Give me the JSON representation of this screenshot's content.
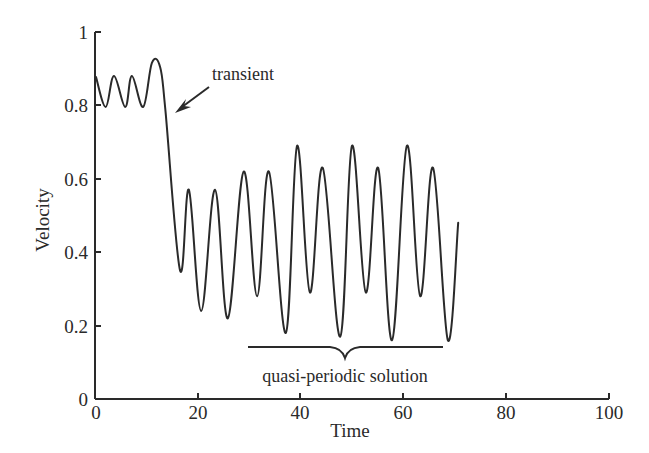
{
  "chart_data": {
    "type": "line",
    "title": "",
    "xlabel": "Time",
    "ylabel": "Velocity",
    "xlim": [
      0,
      100
    ],
    "ylim": [
      0,
      1
    ],
    "grid": false,
    "legend": null,
    "x_ticks": [
      0,
      20,
      40,
      60,
      80,
      100
    ],
    "x_tick_labels": [
      "0",
      "20",
      "40",
      "60",
      "80",
      "100"
    ],
    "y_ticks": [
      0,
      0.2,
      0.4,
      0.6,
      0.8,
      1
    ],
    "y_tick_labels": [
      "0",
      "0.2",
      "0.4",
      "0.6",
      "0.8",
      "1"
    ],
    "series": [
      {
        "name": "Velocity",
        "color": "#2a2a2a",
        "x": [
          0,
          1.9,
          3.5,
          5.7,
          7.0,
          9.2,
          10.9,
          12.5,
          13.5,
          16.4,
          18.1,
          20.5,
          23.2,
          25.7,
          28.8,
          31.4,
          33.7,
          37.0,
          39.2,
          41.7,
          44.2,
          47.6,
          49.9,
          52.6,
          55.0,
          57.7,
          60.6,
          63.2,
          65.7,
          68.6,
          70.6
        ],
        "y": [
          0.877,
          0.796,
          0.88,
          0.796,
          0.88,
          0.796,
          0.916,
          0.905,
          0.79,
          0.35,
          0.57,
          0.24,
          0.57,
          0.22,
          0.62,
          0.28,
          0.62,
          0.18,
          0.69,
          0.29,
          0.63,
          0.17,
          0.69,
          0.29,
          0.63,
          0.16,
          0.69,
          0.28,
          0.63,
          0.16,
          0.48
        ]
      }
    ],
    "annotations": [
      {
        "text": "transient",
        "type": "arrow",
        "text_xy": [
          22,
          0.87
        ],
        "arrow_to": [
          16,
          0.78
        ]
      },
      {
        "text": "quasi-periodic solution",
        "type": "brace",
        "x_range": [
          30,
          67.5
        ],
        "y": 0.14
      }
    ]
  },
  "labels": {
    "xlabel": "Time",
    "ylabel": "Velocity",
    "transient": "transient",
    "quasi": "quasi-periodic solution",
    "xticks": [
      "0",
      "20",
      "40",
      "60",
      "80",
      "100"
    ],
    "yticks": [
      "0",
      "0.2",
      "0.4",
      "0.6",
      "0.8",
      "1"
    ]
  }
}
